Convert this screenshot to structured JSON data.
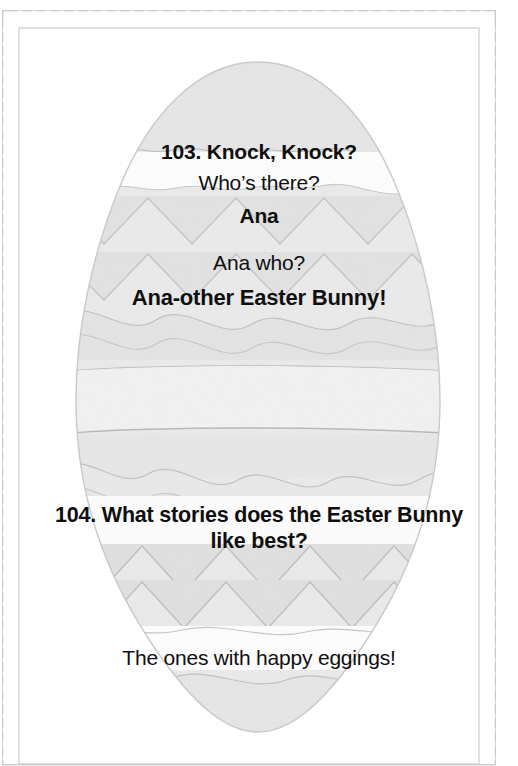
{
  "page": {
    "background_color": "#ffffff"
  },
  "border": {
    "style_name": "postage-stamp-perforated-border",
    "line_color": "#c8c8cc",
    "fill_color": "#ffffff"
  },
  "artwork": {
    "name": "decorated-easter-egg",
    "egg_base_color": "#e9e9e9",
    "band_light_color": "#f2f2f2",
    "band_mid_color": "#e3e3e3",
    "dot_color": "#cfcfcf",
    "outline_color": "#c0c0c0",
    "dot_count": 6
  },
  "jokes": [
    {
      "number": "103.",
      "question": "103. Knock, Knock?",
      "response": "Who’s there?",
      "name": "Ana",
      "follow_up": "Ana who?",
      "punchline": "Ana-other Easter Bunny!"
    },
    {
      "number": "104.",
      "question_line1": "104. What stories does the Easter Bunny",
      "question_line2": "like best?",
      "punchline": "The ones with happy eggings!"
    }
  ]
}
